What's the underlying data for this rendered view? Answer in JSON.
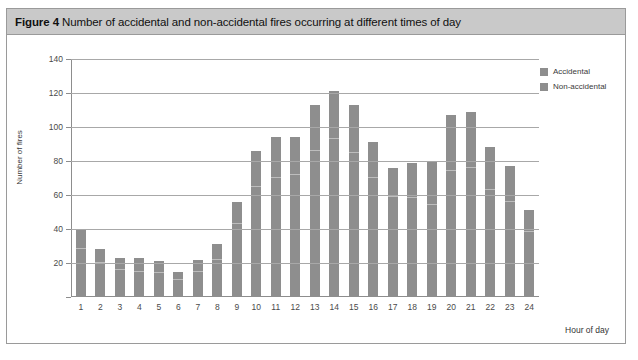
{
  "figure": {
    "label": "Figure 4",
    "caption": "Number of accidental and non-accidental fires occurring at different times of day",
    "full_title": "Figure 4 Number of accidental and non-accidental fires occurring at different times of day"
  },
  "legend": {
    "position": "top-right",
    "items": [
      {
        "label": "Accidental",
        "color": "#8e8e8e"
      },
      {
        "label": "Non-accidental",
        "color": "#8e8e8e"
      }
    ]
  },
  "colors": {
    "bar": "#8e8e8e",
    "segment_divider": "#bdbdbd",
    "gridline": "#a8a8a8",
    "axis": "#8d8d8d",
    "title_bar_bg": "#c9c9c9",
    "frame_border": "#9a9a9a"
  },
  "chart_data": {
    "type": "bar",
    "stacked": true,
    "title": "Number of accidental and non-accidental fires occurring at different times of day",
    "xlabel": "Hour of day",
    "ylabel": "Number of fires",
    "ylim": [
      0,
      140
    ],
    "ytick_step": 20,
    "yticks": [
      0,
      20,
      40,
      60,
      80,
      100,
      120,
      140
    ],
    "grid": true,
    "categories": [
      "1",
      "2",
      "3",
      "4",
      "5",
      "6",
      "7",
      "8",
      "9",
      "10",
      "11",
      "12",
      "13",
      "14",
      "15",
      "16",
      "17",
      "18",
      "19",
      "20",
      "21",
      "22",
      "23",
      "24"
    ],
    "series": [
      {
        "name": "Accidental",
        "values": [
          28,
          20,
          16,
          15,
          14,
          10,
          15,
          22,
          43,
          65,
          70,
          72,
          86,
          93,
          85,
          70,
          59,
          58,
          54,
          74,
          76,
          63,
          56,
          38
        ]
      },
      {
        "name": "Non-accidental",
        "values": [
          12,
          8,
          7,
          8,
          7,
          5,
          7,
          9,
          13,
          21,
          24,
          22,
          27,
          28,
          28,
          21,
          17,
          21,
          26,
          33,
          33,
          25,
          21,
          13
        ]
      }
    ],
    "totals": [
      40,
      28,
      23,
      23,
      21,
      15,
      22,
      31,
      56,
      86,
      94,
      94,
      113,
      121,
      113,
      91,
      76,
      79,
      80,
      107,
      109,
      88,
      77,
      51
    ]
  }
}
